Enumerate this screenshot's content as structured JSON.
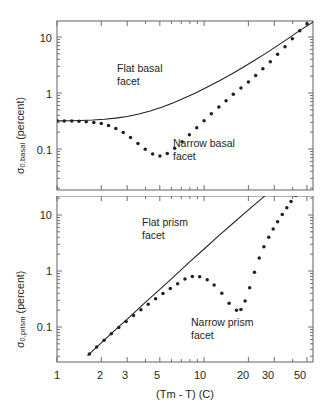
{
  "figure": {
    "background": "#ffffff",
    "ink_color": "#231f20",
    "axis_color": "#6d6e71"
  },
  "chart_data": [
    {
      "type": "line",
      "panel": "top",
      "title": "",
      "xlabel": "",
      "ylabel": "σ 0,basal (percent)",
      "ylabel_main": "σ",
      "ylabel_sub": "0,basal",
      "ylabel_unit": " (percent)",
      "xscale": "log",
      "yscale": "log",
      "xlim": [
        1,
        55
      ],
      "ylim": [
        0.03,
        30
      ],
      "grid": false,
      "legend": "none",
      "xticks_major": [
        1,
        2,
        3,
        5,
        10,
        20,
        30,
        50
      ],
      "xtick_labels": [
        "1",
        "2",
        "3",
        "5",
        "10",
        "20",
        "30",
        "50"
      ],
      "yticks_major": [
        0.1,
        1,
        10
      ],
      "ytick_labels": [
        "0.1",
        "1",
        "10"
      ],
      "series": [
        {
          "name": "Flat basal facet",
          "style": "solid-line",
          "x": [
            1.0,
            1.2,
            1.45,
            1.75,
            2.1,
            2.5,
            3.0,
            3.6,
            4.3,
            5.2,
            6.2,
            7.4,
            8.9,
            10.6,
            12.7,
            15.2,
            18.2,
            21.8,
            26.1,
            31.2,
            37.4,
            44.8,
            55.0
          ],
          "y": [
            0.318,
            0.32,
            0.324,
            0.33,
            0.34,
            0.356,
            0.382,
            0.42,
            0.477,
            0.56,
            0.672,
            0.82,
            1.02,
            1.29,
            1.65,
            2.14,
            2.82,
            3.76,
            5.06,
            6.88,
            9.45,
            13.1,
            18.4
          ]
        },
        {
          "name": "Narrow basal facet",
          "style": "dotted-markers",
          "x": [
            1.0,
            1.12,
            1.26,
            1.41,
            1.58,
            1.78,
            2.0,
            2.24,
            2.51,
            2.82,
            3.16,
            3.55,
            3.98,
            4.47,
            5.01,
            5.62,
            6.31,
            7.08,
            7.94,
            8.91,
            10.0,
            11.2,
            12.6,
            14.1,
            15.8,
            17.8,
            20.0,
            22.4,
            25.1,
            28.2,
            31.6,
            35.5,
            39.8,
            44.7,
            50.1,
            55.0
          ],
          "y": [
            0.318,
            0.317,
            0.315,
            0.312,
            0.307,
            0.298,
            0.284,
            0.262,
            0.232,
            0.197,
            0.16,
            0.126,
            0.099,
            0.081,
            0.075,
            0.083,
            0.103,
            0.135,
            0.18,
            0.24,
            0.32,
            0.425,
            0.56,
            0.73,
            0.95,
            1.23,
            1.58,
            2.05,
            2.7,
            3.6,
            4.9,
            6.7,
            9.3,
            12.9,
            17.2,
            20.5
          ]
        }
      ],
      "annotations": [
        {
          "text": "Flat basal\nfacet",
          "line1": "Flat basal",
          "line2": "facet",
          "x_px": 118,
          "y_px": 64
        },
        {
          "text": "Narrow basal\nfacet",
          "line1": "Narrow basal",
          "line2": "facet",
          "x_px": 175,
          "y_px": 139
        }
      ]
    },
    {
      "type": "line",
      "panel": "bottom",
      "title": "",
      "xlabel": "(Tm - T) (C)",
      "ylabel": "σ 0,prism (percent)",
      "ylabel_main": "σ",
      "ylabel_sub": "0,prism",
      "ylabel_unit": " (percent)",
      "xscale": "log",
      "yscale": "log",
      "xlim": [
        1,
        55
      ],
      "ylim": [
        0.03,
        30
      ],
      "grid": false,
      "legend": "none",
      "xticks_major": [
        1,
        2,
        3,
        5,
        10,
        20,
        30,
        50
      ],
      "xtick_labels": [
        "1",
        "2",
        "3",
        "5",
        "10",
        "20",
        "30",
        "50"
      ],
      "yticks_major": [
        0.1,
        1,
        10
      ],
      "ytick_labels": [
        "0.1",
        "1",
        "10"
      ],
      "series": [
        {
          "name": "Flat prism facet",
          "style": "solid-line",
          "x": [
            1.62,
            2.0,
            2.5,
            3.16,
            4.0,
            5.0,
            6.31,
            7.94,
            10.0,
            12.6,
            15.8,
            20.0,
            25.1,
            31.6,
            39.8,
            44.0
          ],
          "y": [
            0.031,
            0.052,
            0.09,
            0.157,
            0.277,
            0.47,
            0.82,
            1.44,
            2.47,
            4.3,
            7.2,
            12.3,
            20.5,
            34.0,
            56.0,
            68.0
          ]
        },
        {
          "name": "Narrow prism facet",
          "style": "dotted-markers",
          "x": [
            1.66,
            1.86,
            2.09,
            2.34,
            2.63,
            2.95,
            3.31,
            3.72,
            4.17,
            4.68,
            5.25,
            5.89,
            6.61,
            7.41,
            8.32,
            9.33,
            10.5,
            11.7,
            13.2,
            14.8,
            16.6,
            17.8,
            19.0,
            20.4,
            22.0,
            23.7,
            25.5,
            27.5,
            29.5,
            31.6,
            34.0,
            36.5,
            39.0,
            42.0,
            45.0
          ],
          "y": [
            0.033,
            0.044,
            0.058,
            0.076,
            0.098,
            0.126,
            0.16,
            0.203,
            0.255,
            0.318,
            0.395,
            0.487,
            0.595,
            0.72,
            0.8,
            0.79,
            0.7,
            0.56,
            0.4,
            0.265,
            0.2,
            0.205,
            0.29,
            0.5,
            0.95,
            1.7,
            2.7,
            4.0,
            5.6,
            7.6,
            10.2,
            13.5,
            17.5,
            22.5,
            28.0
          ]
        }
      ],
      "annotations": [
        {
          "text": "Flat prism\nfacet",
          "line1": "Flat prism",
          "line2": "facet",
          "x_px": 143,
          "y_px": 218
        },
        {
          "text": "Narrow prism\nfacet",
          "line1": "Narrow prism",
          "line2": "facet",
          "x_px": 192,
          "y_px": 318
        }
      ]
    }
  ],
  "labels": {
    "top_ylabel_sigma": "σ",
    "top_ylabel_sub": "0,basal",
    "top_ylabel_rest": " (percent)",
    "bottom_ylabel_sigma": "σ",
    "bottom_ylabel_sub": "0,prism",
    "bottom_ylabel_rest": " (percent)",
    "xaxis_title": "(Tm - T) (C)",
    "top_ytick_10": "10",
    "top_ytick_1": "1",
    "top_ytick_01": "0.1",
    "bottom_ytick_10": "10",
    "bottom_ytick_1": "1",
    "bottom_ytick_01": "0.1",
    "xtick_1": "1",
    "xtick_2": "2",
    "xtick_3": "3",
    "xtick_5": "5",
    "xtick_10": "10",
    "xtick_20": "20",
    "xtick_30": "30",
    "xtick_50": "50",
    "annot_flat_basal_1": "Flat basal",
    "annot_flat_basal_2": "facet",
    "annot_narrow_basal_1": "Narrow basal",
    "annot_narrow_basal_2": "facet",
    "annot_flat_prism_1": "Flat prism",
    "annot_flat_prism_2": "facet",
    "annot_narrow_prism_1": "Narrow prism",
    "annot_narrow_prism_2": "facet"
  }
}
